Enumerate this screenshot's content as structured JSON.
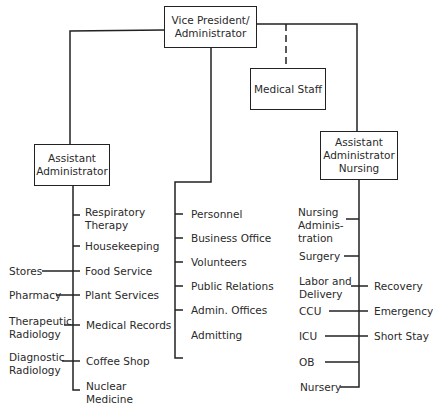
{
  "org_chart": {
    "top": {
      "label": "Vice President/\nAdministrator"
    },
    "staff": {
      "label": "Medical Staff",
      "relation": "dashed"
    },
    "branches": [
      {
        "head": "Assistant\nAdministrator",
        "reports": [
          "Respiratory\nTherapy",
          "Housekeeping",
          "Food Service",
          "Plant Services",
          "Medical Records",
          "Coffee Shop",
          "Nuclear\nMedicine"
        ],
        "side_reports": [
          "Stores",
          "Pharmacy",
          "Therapeutic\nRadiology",
          "Diagnostic\nRadiology"
        ]
      },
      {
        "head": null,
        "reports": [
          "Personnel",
          "Business Office",
          "Volunteers",
          "Public Relations",
          "Admin. Offices",
          "Admitting"
        ]
      },
      {
        "head": "Assistant\nAdministrator\nNursing",
        "reports": [
          "Nursing\nAdminis-\ntration",
          "Surgery",
          "Labor and\nDelivery",
          "CCU",
          "ICU",
          "OB",
          "Nursery"
        ],
        "side_reports": [
          "Recovery",
          "Emergency",
          "Short Stay"
        ]
      }
    ]
  }
}
